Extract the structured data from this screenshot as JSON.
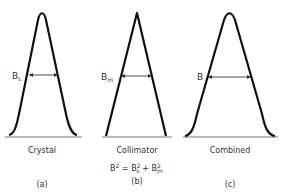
{
  "panels": [
    {
      "id": "a",
      "profile_shape": "bell (rounded peak, curved tails)",
      "width_label": "B",
      "width_label_subscript": "c",
      "caption": "Crystal",
      "figure_label": "(a)"
    },
    {
      "id": "b",
      "profile_shape": "triangle (sharp peak, straight sides)",
      "width_label": "B",
      "width_label_subscript": "m",
      "caption": "Collimator",
      "figure_label": "(b)",
      "equation": {
        "lhs": "B",
        "lhs_sup": "2",
        "eq": " = ",
        "t1": "B",
        "t1_sup": "2",
        "t1_sub": "c",
        "plus": " + ",
        "t2": "B",
        "t2_sup": "2",
        "t2_sub": "m"
      }
    },
    {
      "id": "c",
      "profile_shape": "bell (rounded peak, curved tails)",
      "width_label": "B",
      "width_label_subscript": "",
      "caption": "Combined",
      "figure_label": "(c)"
    }
  ],
  "colors": {
    "curve": "#111111",
    "baseline": "#777777",
    "text": "#333333"
  }
}
